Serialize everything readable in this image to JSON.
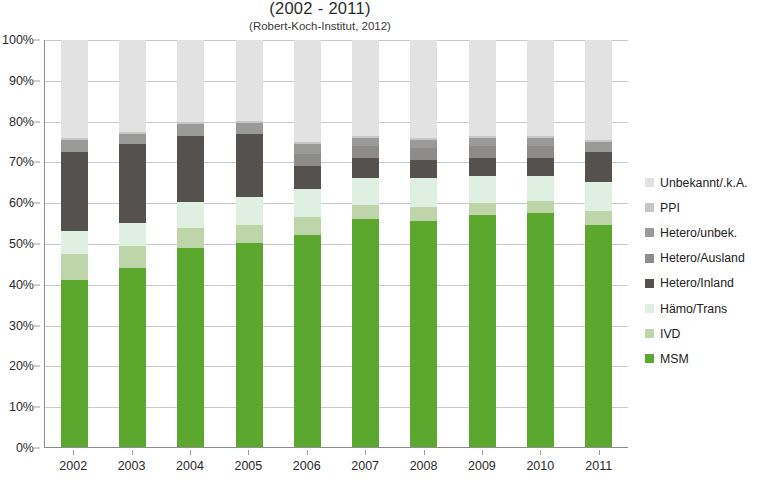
{
  "chart_data": {
    "type": "bar",
    "subtype": "stacked-100-percent",
    "title": "(2002 - 2011)",
    "subtitle": "(Robert-Koch-Institut, 2012)",
    "xlabel": "",
    "ylabel": "",
    "ylim": [
      0,
      100
    ],
    "y_unit": "%",
    "grid": true,
    "legend_position": "right",
    "categories": [
      "2002",
      "2003",
      "2004",
      "2005",
      "2006",
      "2007",
      "2008",
      "2009",
      "2010",
      "2011"
    ],
    "y_ticks": [
      "0%",
      "10%",
      "20%",
      "30%",
      "40%",
      "50%",
      "60%",
      "70%",
      "80%",
      "90%",
      "100%"
    ],
    "series": [
      {
        "name": "MSM",
        "color": "#5ca82f",
        "values": [
          41.0,
          44.0,
          48.8,
          50.0,
          52.0,
          56.0,
          55.5,
          57.0,
          57.5,
          54.5
        ]
      },
      {
        "name": "IVD",
        "color": "#bdd5a8",
        "values": [
          6.5,
          5.5,
          5.0,
          4.5,
          4.5,
          3.5,
          3.5,
          3.0,
          3.0,
          3.5
        ]
      },
      {
        "name": "Hämo/Trans",
        "color": "#dff0e2",
        "values": [
          5.5,
          5.5,
          6.5,
          7.0,
          7.0,
          6.5,
          7.0,
          6.5,
          6.0,
          7.0
        ]
      },
      {
        "name": "Hetero/Inland",
        "color": "#55514f",
        "values": [
          19.5,
          19.5,
          16.0,
          15.5,
          5.5,
          5.0,
          4.5,
          4.5,
          4.5,
          7.5
        ]
      },
      {
        "name": "Hetero/Ausland",
        "color": "#8e8c8a",
        "values": [
          0.0,
          0.0,
          0.0,
          0.0,
          3.0,
          3.0,
          3.0,
          3.0,
          3.0,
          0.0
        ]
      },
      {
        "name": "Hetero/unbek.",
        "color": "#9a9a98",
        "values": [
          3.0,
          2.5,
          3.0,
          2.5,
          2.5,
          2.0,
          2.0,
          2.0,
          2.0,
          2.5
        ]
      },
      {
        "name": "PPI",
        "color": "#c6c6c6",
        "values": [
          0.5,
          0.5,
          0.5,
          0.5,
          0.5,
          0.5,
          0.5,
          0.5,
          0.5,
          0.5
        ]
      },
      {
        "name": "Unbekannt/.k.A.",
        "color": "#e2e2e2",
        "values": [
          24.0,
          22.5,
          20.2,
          20.0,
          25.0,
          23.5,
          24.0,
          23.5,
          23.5,
          24.5
        ]
      }
    ],
    "legend_entries": [
      {
        "label": "Unbekannt/.k.A.",
        "color": "#e2e2e2"
      },
      {
        "label": "PPI",
        "color": "#c6c6c6"
      },
      {
        "label": "Hetero/unbek.",
        "color": "#9a9a98"
      },
      {
        "label": "Hetero/Ausland",
        "color": "#8e8c8a"
      },
      {
        "label": "Hetero/Inland",
        "color": "#55514f"
      },
      {
        "label": "Hämo/Trans",
        "color": "#dff0e2"
      },
      {
        "label": "IVD",
        "color": "#bdd5a8"
      },
      {
        "label": "MSM",
        "color": "#5ca82f"
      }
    ]
  }
}
